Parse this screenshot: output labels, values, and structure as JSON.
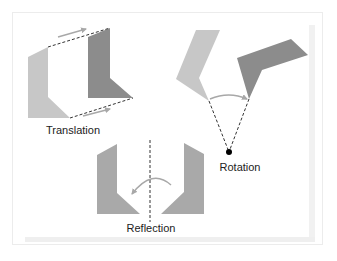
{
  "diagram": {
    "colors": {
      "light_shape": "#c7c7c7",
      "mid_shape": "#a9a9a9",
      "dark_shape": "#8c8c8c",
      "arrow": "#a8a8a8",
      "dashed": "#333333",
      "pivot": "#000000",
      "frame": "#ececec"
    },
    "panels": [
      {
        "id": "translation",
        "label": "Translation"
      },
      {
        "id": "rotation",
        "label": "Rotation"
      },
      {
        "id": "reflection",
        "label": "Reflection"
      }
    ]
  }
}
